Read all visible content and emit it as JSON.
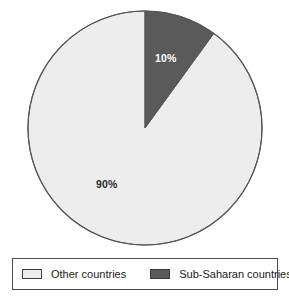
{
  "chart_data": {
    "type": "pie",
    "title": "",
    "subtitle": "",
    "xlabel": "",
    "ylabel": "",
    "grid": false,
    "legend_position": "bottom",
    "start_angle_deg": 0,
    "direction": "clockwise",
    "categories": [
      "Other countries",
      "Sub-Saharan countries"
    ],
    "values": [
      90,
      10
    ],
    "labels": [
      "90%",
      "10%"
    ],
    "slices": [
      {
        "name": "Other countries",
        "value": 90,
        "label": "90%",
        "color": "#ededed",
        "label_color": "#2b2b2b",
        "start_deg": 36,
        "end_deg": 360
      },
      {
        "name": "Sub-Saharan countries",
        "value": 10,
        "label": "10%",
        "color": "#5a5a5a",
        "label_color": "#ffffff",
        "start_deg": 0,
        "end_deg": 36
      }
    ],
    "annotations": []
  },
  "pie": {
    "center_x": 145,
    "center_y": 128,
    "radius": 117,
    "outline_color": "#555555",
    "light_slice_label": "90%",
    "dark_slice_label": "10%"
  },
  "legend": {
    "border_color": "#4a4a4a",
    "background": "#ffffff",
    "items": [
      {
        "label": "Other countries",
        "swatch_color": "#ededed",
        "swatch_border": "#3c3c3c"
      },
      {
        "label": "Sub-Saharan countries",
        "swatch_color": "#5a5a5a",
        "swatch_border": "#3c3c3c"
      }
    ]
  },
  "colors": {
    "background": "#ffffff",
    "other_countries": "#ededed",
    "sub_saharan": "#5a5a5a",
    "outline": "#555555",
    "text": "#222222"
  }
}
